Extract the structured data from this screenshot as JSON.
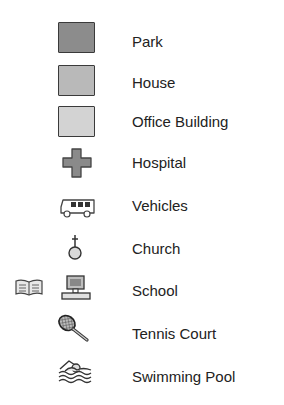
{
  "legend": {
    "items": [
      {
        "label": "Park",
        "icon": "park-swatch",
        "color": "#8c8c8c"
      },
      {
        "label": "House",
        "icon": "house-swatch",
        "color": "#b9b9b9"
      },
      {
        "label": "Office Building",
        "icon": "office-building-swatch",
        "color": "#d3d3d3"
      },
      {
        "label": "Hospital",
        "icon": "cross-icon",
        "color": "#8a8a8a"
      },
      {
        "label": "Vehicles",
        "icon": "bus-icon"
      },
      {
        "label": "Church",
        "icon": "church-icon"
      },
      {
        "label": "School",
        "icon": "book-and-computer-icon"
      },
      {
        "label": "Tennis Court",
        "icon": "tennis-racket-icon"
      },
      {
        "label": "Swimming Pool",
        "icon": "swimmer-icon"
      }
    ]
  }
}
